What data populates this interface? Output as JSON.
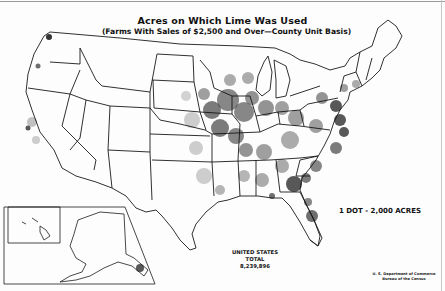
{
  "map": {
    "title": "Acres on Which Lime Was Used",
    "subtitle": "(Farms With Sales of $2,500 and Over—County Unit Basis)",
    "legend": {
      "label": "1 DOT - 2,000 ACRES",
      "dot_value_acres": 2000,
      "dot_color": "#111111"
    },
    "total": {
      "line1": "UNITED STATES",
      "line2": "TOTAL",
      "value": "8,239,896"
    },
    "source": {
      "line1": "U. S. Department of Commerce",
      "line2": "Bureau of the Census"
    },
    "insets": [
      "Alaska",
      "Hawaii"
    ],
    "colors": {
      "background": "#fdfdfd",
      "outline": "#1a1a1a",
      "dots": "#111111"
    },
    "density_regions": [
      {
        "name": "Corn Belt (IA/IL/IN/MO/WI)",
        "level": "very high"
      },
      {
        "name": "Mid-Atlantic (PA/MD/VA)",
        "level": "very high"
      },
      {
        "name": "Southeast (GA/AL/Carolinas)",
        "level": "high"
      },
      {
        "name": "Florida",
        "level": "high"
      },
      {
        "name": "Ohio / Kentucky / Tennessee",
        "level": "high"
      },
      {
        "name": "Great Plains",
        "level": "low"
      },
      {
        "name": "Mountain West",
        "level": "very low"
      },
      {
        "name": "Pacific Coast (WA/OR/CA)",
        "level": "low"
      }
    ]
  }
}
